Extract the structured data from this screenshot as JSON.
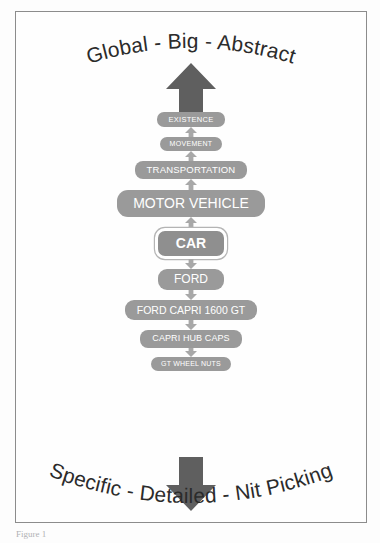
{
  "figure": {
    "heading_top": "Global - Big - Abstract",
    "heading_bottom": "Specific - Detailed - Nit Picking",
    "caption": "Figure 1",
    "frame_color": "#8c8c8c",
    "node_color": "#9a9a9a",
    "node_text_color": "#ffffff",
    "arrow_color": "#5f5f5f",
    "connector_color": "#a8a8a8",
    "focus_ring_color": "#ffffff"
  },
  "arrows": {
    "top_big": "big-up-arrow",
    "bottom_big": "big-down-arrow",
    "up_connector": "up-arrow-icon",
    "down_connector": "down-arrow-icon"
  },
  "chart_data": {
    "type": "diagram",
    "subtype": "abstraction-ladder",
    "title": "Global - Big - Abstract",
    "footer": "Specific - Detailed - Nit Picking",
    "direction_up": "more abstract",
    "direction_down": "more specific",
    "focus_level": 5,
    "levels": [
      {
        "rank": 1,
        "label": "EXISTENCE",
        "tier": "tier-1",
        "arrow_below": "up"
      },
      {
        "rank": 2,
        "label": "MOVEMENT",
        "tier": "tier-2",
        "arrow_below": "up"
      },
      {
        "rank": 3,
        "label": "TRANSPORTATION",
        "tier": "tier-3",
        "arrow_below": "up"
      },
      {
        "rank": 4,
        "label": "MOTOR VEHICLE",
        "tier": "tier-4",
        "arrow_below": "up"
      },
      {
        "rank": 5,
        "label": "CAR",
        "tier": "tier-5",
        "arrow_below": "down",
        "focus": true
      },
      {
        "rank": 6,
        "label": "FORD",
        "tier": "tier-6",
        "arrow_below": "down"
      },
      {
        "rank": 7,
        "label": "FORD CAPRI 1600 GT",
        "tier": "tier-7",
        "arrow_below": "down"
      },
      {
        "rank": 8,
        "label": "CAPRI HUB CAPS",
        "tier": "tier-8",
        "arrow_below": "down"
      },
      {
        "rank": 9,
        "label": "GT WHEEL NUTS",
        "tier": "tier-9",
        "arrow_below": null
      }
    ]
  }
}
